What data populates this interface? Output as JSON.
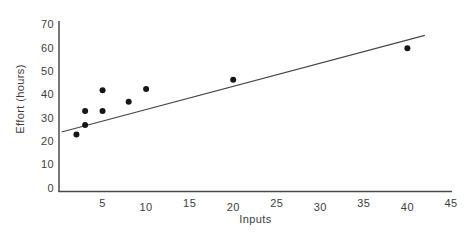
{
  "chart_data": {
    "type": "scatter",
    "title": "",
    "xlabel": "Inputs",
    "ylabel": "Effort (hours)",
    "xlim": [
      0,
      45
    ],
    "ylim": [
      0,
      70
    ],
    "x_ticks": [
      5,
      10,
      15,
      20,
      25,
      30,
      35,
      40,
      45
    ],
    "y_ticks": [
      0,
      10,
      20,
      30,
      40,
      50,
      60,
      70
    ],
    "grid": false,
    "legend": "none",
    "points": [
      [
        2,
        23
      ],
      [
        3,
        27
      ],
      [
        3,
        33
      ],
      [
        5,
        33
      ],
      [
        5,
        42
      ],
      [
        8,
        37
      ],
      [
        10,
        42.5
      ],
      [
        20,
        46.5
      ],
      [
        40,
        60
      ]
    ],
    "trendline": {
      "x1": 0.3,
      "y1": 24,
      "x2": 42,
      "y2": 65.5
    },
    "point_color": "#161616",
    "trendline_color": "#464646",
    "axis_color": "#4a4a4a",
    "text_color": "#3d3d3d"
  }
}
